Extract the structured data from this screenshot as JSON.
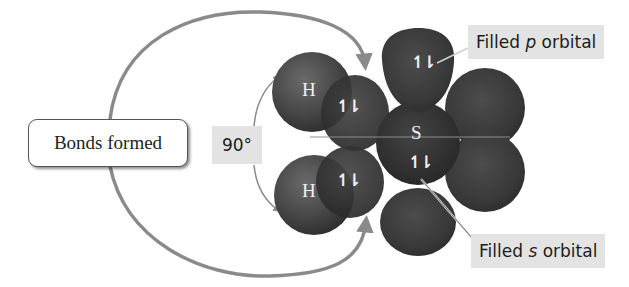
{
  "diagram": {
    "labels": {
      "bonds_formed": "Bonds formed",
      "angle": "90°",
      "filled_p_prefix": "Filled ",
      "filled_p_letter": "p",
      "filled_p_suffix": " orbital",
      "filled_s_prefix": "Filled ",
      "filled_s_letter": "s",
      "filled_s_suffix": " orbital"
    },
    "atoms": {
      "hydrogen_top": "H",
      "hydrogen_bottom": "H",
      "sulfur": "S"
    },
    "electron_pairs": {
      "bond_top": "↿⇂",
      "bond_bottom": "↿⇂",
      "p_orbital": "↿⇂",
      "s_orbital": "↿⇂"
    },
    "colors": {
      "orbital_fill": "#3a3a3a",
      "hydrogen_fill": "#4a4a4a",
      "arrow": "#8a8a8a",
      "callout_bg": "#e3e3e3"
    }
  }
}
